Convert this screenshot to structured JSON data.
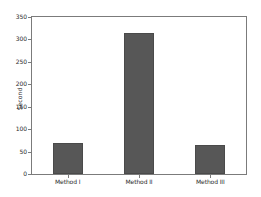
{
  "chart_data": {
    "type": "bar",
    "title": "",
    "subtitle": "",
    "xlabel": "",
    "ylabel": "Second",
    "categories": [
      "Method I",
      "Method II",
      "Method III"
    ],
    "values": [
      70,
      315,
      65
    ],
    "series": [
      {
        "name": "Second",
        "values": [
          70,
          315,
          65
        ]
      }
    ],
    "ylim": [
      0,
      350
    ],
    "yticks": [
      0,
      50,
      100,
      150,
      200,
      250,
      300,
      350
    ],
    "ytick_labels": [
      "0",
      "50",
      "100",
      "150",
      "200",
      "250",
      "300",
      "350"
    ],
    "grid": false,
    "legend": false,
    "legend_position": "none",
    "bar_color": "#575757",
    "bar_edge_color": "#4a4a4a",
    "axes_color": "#7b7b7b",
    "background_color": "#ffffff"
  }
}
